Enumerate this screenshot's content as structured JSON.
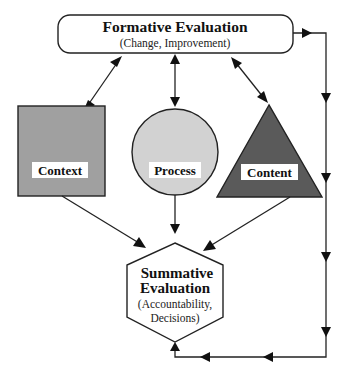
{
  "diagram": {
    "type": "evaluation-flow",
    "colors": {
      "context_fill": "#a0a0a0",
      "process_fill": "#d2d2d2",
      "content_fill": "#5a5a5a",
      "stroke": "#222222",
      "background": "#ffffff"
    },
    "formative": {
      "title": "Formative Evaluation",
      "subtitle": "(Change, Improvement)"
    },
    "nodes": {
      "context": {
        "label": "Context",
        "shape": "square"
      },
      "process": {
        "label": "Process",
        "shape": "circle"
      },
      "content": {
        "label": "Content",
        "shape": "triangle"
      }
    },
    "summative": {
      "title_line1": "Summative",
      "title_line2": "Evaluation",
      "subtitle_line1": "(Accountability,",
      "subtitle_line2": "Decisions)"
    },
    "edges": [
      {
        "from": "formative",
        "to": "context",
        "type": "bidirectional"
      },
      {
        "from": "formative",
        "to": "process",
        "type": "bidirectional"
      },
      {
        "from": "formative",
        "to": "content",
        "type": "bidirectional"
      },
      {
        "from": "context",
        "to": "summative",
        "type": "directed"
      },
      {
        "from": "process",
        "to": "summative",
        "type": "directed"
      },
      {
        "from": "content",
        "to": "summative",
        "type": "directed"
      },
      {
        "from": "formative",
        "to": "summative",
        "type": "directed",
        "route": "right-side feedback loop"
      }
    ]
  }
}
